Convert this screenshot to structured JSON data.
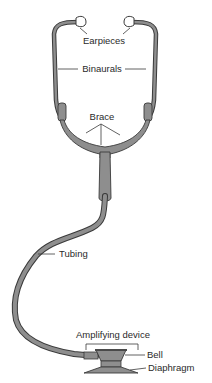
{
  "diagram": {
    "labels": {
      "earpieces": "Earpieces",
      "binaurals": "Binaurals",
      "brace": "Brace",
      "tubing": "Tubing",
      "amplifying_device": "Amplifying device",
      "bell": "Bell",
      "diaphragm": "Diaphragm"
    },
    "colors": {
      "tube_fill": "#8e8e8e",
      "outline": "#3a3a3a",
      "earpiece_fill": "#ffffff",
      "text": "#2a2a2a"
    }
  }
}
